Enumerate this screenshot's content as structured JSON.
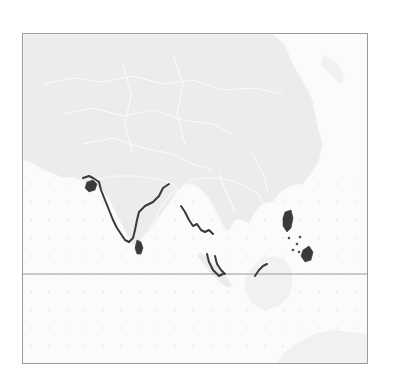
{
  "map": {
    "region": "South and Southeast Asia",
    "projection_lines": {
      "equator": true
    },
    "highlighted_coastlines": [
      "India west coast",
      "India east coast (southern)",
      "Sri Lanka",
      "Gulf of Kutch",
      "Myanmar coast",
      "Thai / Malay peninsula west coast",
      "Sumatra (northeast)",
      "Borneo (northwest)",
      "Philippines (Luzon, Mindanao, Visayas)"
    ],
    "colors": {
      "land": "#ececec",
      "ocean": "#fbfbfb",
      "highlight": "#3a3a3a",
      "frame": "#9a9a9a"
    }
  }
}
